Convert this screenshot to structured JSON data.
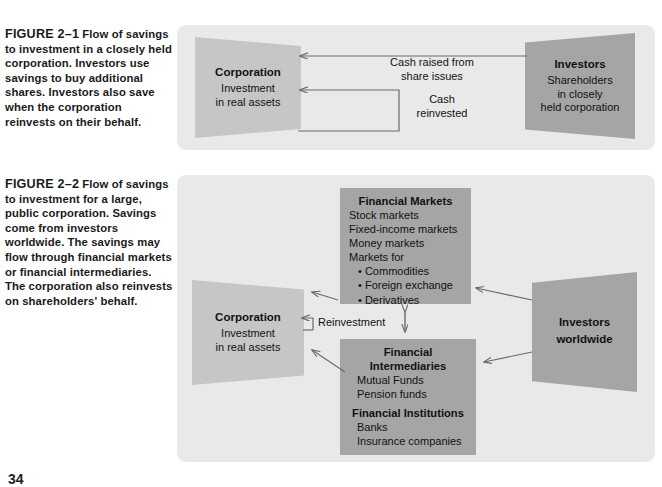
{
  "page": {
    "number": "34"
  },
  "figure1": {
    "label": "FIGURE 2–1",
    "caption": "Flow of savings to investment in a closely held corporation. Investors use savings to buy additional shares. Investors also save when the corporation reinvests on their behalf.",
    "corporation": {
      "title": "Corporation",
      "line1": "Investment",
      "line2": "in real assets"
    },
    "investors": {
      "title": "Investors",
      "line1": "Shareholders",
      "line2": "in closely",
      "line3": "held corporation"
    },
    "arrows": {
      "cash_raised": "Cash raised from share issues",
      "cash_raised_l1": "Cash raised from",
      "cash_raised_l2": "share issues",
      "cash_reinvested": "Cash reinvested",
      "cash_reinvested_l1": "Cash",
      "cash_reinvested_l2": "reinvested"
    }
  },
  "figure2": {
    "label": "FIGURE 2–2",
    "caption": "Flow of savings to investment for a large, public corporation. Savings come from investors worldwide. The savings may flow through financial markets or financial intermediaries. The corporation also reinvests on shareholders' behalf.",
    "corporation": {
      "title": "Corporation",
      "line1": "Investment",
      "line2": "in real assets"
    },
    "investors": {
      "line1": "Investors",
      "line2": "worldwide"
    },
    "financial_markets": {
      "heading": "Financial Markets",
      "items": [
        "Stock markets",
        "Fixed-income markets",
        "Money markets",
        "Markets for"
      ],
      "bullets": [
        "• Commodities",
        "• Foreign exchange",
        "• Derivatives"
      ]
    },
    "financial_intermediaries": {
      "heading_l1": "Financial",
      "heading_l2": "Intermediaries",
      "items": [
        "Mutual Funds",
        "Pension funds"
      ],
      "subheading": "Financial Institutions",
      "sub_items": [
        "Banks",
        "Insurance companies"
      ]
    },
    "arrows": {
      "reinvestment": "Reinvestment"
    }
  },
  "colors": {
    "panel_background": "#e9e9e9",
    "shape_light": "#c6c6c6",
    "shape_dark": "#a5a5a5",
    "arrow_stroke": "#6b6b6b",
    "text": "#111111"
  }
}
